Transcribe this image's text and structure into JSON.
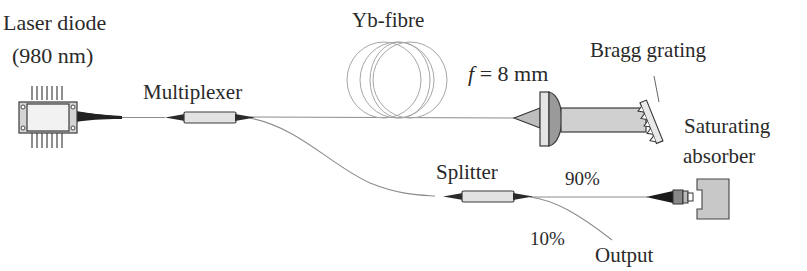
{
  "diagram": {
    "type": "fibre-laser-setup",
    "labels": {
      "laser_diode_line1": "Laser diode",
      "laser_diode_line2": "(980 nm)",
      "multiplexer": "Multiplexer",
      "yb_fibre": "Yb-fibre",
      "focal_f": "f",
      "focal_value": " = 8 mm",
      "bragg_grating": "Bragg grating",
      "saturating_line1": "Saturating",
      "saturating_line2": "absorber",
      "splitter": "Splitter",
      "ratio_90": "90%",
      "ratio_10": "10%",
      "output": "Output"
    },
    "components": [
      {
        "id": "laser-diode",
        "label": "Laser diode (980 nm)"
      },
      {
        "id": "multiplexer",
        "label": "Multiplexer"
      },
      {
        "id": "yb-fibre-coil",
        "label": "Yb-fibre"
      },
      {
        "id": "lens",
        "label": "f = 8 mm"
      },
      {
        "id": "bragg-grating",
        "label": "Bragg grating"
      },
      {
        "id": "splitter",
        "label": "Splitter"
      },
      {
        "id": "saturating-absorber",
        "label": "Saturating absorber"
      }
    ],
    "connections": [
      {
        "from": "laser-diode",
        "to": "multiplexer"
      },
      {
        "from": "multiplexer",
        "to": "yb-fibre-coil"
      },
      {
        "from": "yb-fibre-coil",
        "to": "lens"
      },
      {
        "from": "lens",
        "to": "bragg-grating"
      },
      {
        "from": "multiplexer",
        "to": "splitter"
      },
      {
        "from": "splitter",
        "to": "saturating-absorber",
        "ratio": "90%"
      },
      {
        "from": "splitter",
        "to": "output",
        "ratio": "10%"
      }
    ],
    "colors": {
      "text": "#2a2a2a",
      "fibre": "#8c8c8c",
      "component_fill": "#e6e6e6",
      "lens_dark": "#9a9a9a",
      "absorber_fill": "#c8c8c8"
    }
  }
}
